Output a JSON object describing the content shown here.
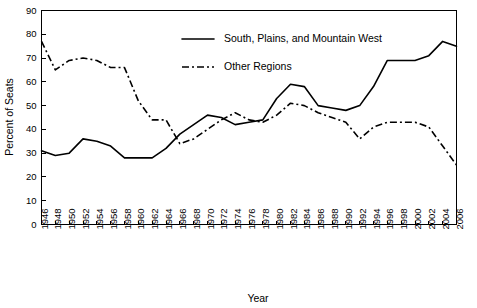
{
  "chart_data": {
    "type": "line",
    "title": "",
    "xlabel": "Year",
    "ylabel": "Percent of Seats",
    "xlim": [
      1946,
      2006
    ],
    "ylim": [
      0,
      90
    ],
    "ytick_step": 10,
    "xtick_step": 2,
    "grid": false,
    "legend_position": "top-center",
    "categories": [
      1946,
      1948,
      1950,
      1952,
      1954,
      1956,
      1958,
      1960,
      1962,
      1964,
      1966,
      1968,
      1970,
      1972,
      1974,
      1976,
      1978,
      1980,
      1982,
      1984,
      1986,
      1988,
      1990,
      1992,
      1994,
      1996,
      1998,
      2000,
      2002,
      2004,
      2006
    ],
    "xticklabels": [
      "1946",
      "1948",
      "1950",
      "1952",
      "1954",
      "1956",
      "1958",
      "1960",
      "1962",
      "1964",
      "1966",
      "1968",
      "1970",
      "1972",
      "1974",
      "1976",
      "1978",
      "1980",
      "1982",
      "1984",
      "1986",
      "1988",
      "1990",
      "1992",
      "1994",
      "1996",
      "1998",
      "2000",
      "2002",
      "2004",
      "2006"
    ],
    "yticklabels": [
      "0",
      "10",
      "20",
      "30",
      "40",
      "50",
      "60",
      "70",
      "80",
      "90"
    ],
    "yticks": [
      0,
      10,
      20,
      30,
      40,
      50,
      60,
      70,
      80,
      90
    ],
    "series": [
      {
        "name": "South, Plains, and Mountain West",
        "style": "solid",
        "color": "#000000",
        "values": [
          31,
          29,
          30,
          36,
          35,
          33,
          28,
          28,
          28,
          32,
          38,
          42,
          46,
          45,
          42,
          43,
          44,
          53,
          59,
          58,
          50,
          49,
          48,
          50,
          58,
          69,
          69,
          69,
          71,
          77,
          75
        ]
      },
      {
        "name": "Other Regions",
        "style": "dash-dot",
        "color": "#000000",
        "values": [
          77,
          65,
          69,
          70,
          69,
          66,
          66,
          52,
          44,
          44,
          34,
          36,
          40,
          44,
          47,
          44,
          43,
          46,
          51,
          50,
          47,
          45,
          43,
          36,
          41,
          43,
          43,
          43,
          41,
          33,
          25
        ]
      }
    ]
  },
  "legend": {
    "entries": [
      {
        "label": "South, Plains, and Mountain West",
        "style": "solid"
      },
      {
        "label": "Other Regions",
        "style": "dash-dot"
      }
    ]
  }
}
